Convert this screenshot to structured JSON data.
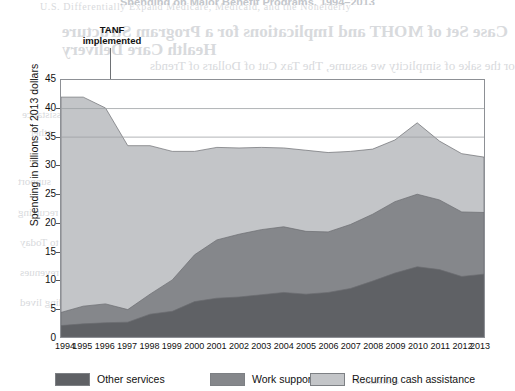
{
  "page": {
    "clipped_header": "Spending on Major Benefit Programs, 1994–2013"
  },
  "bleed_through": {
    "l1": "U.S. Differentially Expand Medicare, Medicaid, and the Nonelderly",
    "l2": "Case Set of MOHT and Implications for a Program Structure",
    "l3": "Health Care Delivery",
    "l4": "or the sake of simplicity we assume, The Tax Cut of Dollars of Trends",
    "l5": "assistance",
    "l6": "other",
    "l7": "support",
    "l8": "recurring",
    "l9": "How did data expenditures come to Today",
    "l10": "shape of revenues",
    "l11": "spending lived",
    "l12": "assistance"
  },
  "annotation": {
    "line1": "TANF",
    "line2": "implemented"
  },
  "axis": {
    "y_title": "Spending in billions of 2013 dollars",
    "y_ticks": [
      "0",
      "5",
      "10",
      "15",
      "20",
      "25",
      "30",
      "35",
      "40",
      "45"
    ],
    "x_ticks": [
      "1994",
      "1995",
      "1996",
      "1997",
      "1998",
      "1999",
      "2000",
      "2001",
      "2002",
      "2003",
      "2004",
      "2005",
      "2006",
      "2007",
      "2008",
      "2009",
      "2010",
      "2011",
      "2012",
      "2013"
    ]
  },
  "legend": {
    "items": [
      {
        "label": "Other services",
        "color": "#5f6165"
      },
      {
        "label": "Work support",
        "color": "#85878b"
      },
      {
        "label": "Recurring cash assistance",
        "color": "#c3c5c8"
      }
    ]
  },
  "chart_data": {
    "type": "area",
    "stacked": true,
    "title": "Spending on Major Benefit Programs, 1994–2013",
    "xlabel": "",
    "ylabel": "Spending in billions of 2013 dollars",
    "ylim": [
      0,
      45
    ],
    "grid": true,
    "gridlines": [
      35,
      40,
      45
    ],
    "annotations": [
      {
        "text": "TANF implemented",
        "x": "1996.5",
        "type": "vertical-line"
      }
    ],
    "legend_position": "bottom",
    "x": [
      1994,
      1995,
      1996,
      1997,
      1998,
      1999,
      2000,
      2001,
      2002,
      2003,
      2004,
      2005,
      2006,
      2007,
      2008,
      2009,
      2010,
      2011,
      2012,
      2013
    ],
    "series": [
      {
        "name": "Other services",
        "color": "#5f6165",
        "values": [
          2.0,
          2.3,
          2.5,
          2.6,
          4.0,
          4.5,
          6.2,
          6.8,
          7.0,
          7.4,
          7.8,
          7.5,
          7.8,
          8.5,
          9.8,
          11.2,
          12.3,
          11.8,
          10.6,
          11.0
        ]
      },
      {
        "name": "Work support",
        "color": "#85878b",
        "values": [
          2.3,
          3.1,
          3.3,
          2.2,
          3.5,
          5.5,
          8.2,
          10.2,
          11.0,
          11.4,
          11.5,
          11.0,
          10.6,
          11.2,
          11.7,
          12.5,
          12.7,
          12.2,
          11.3,
          10.8
        ]
      },
      {
        "name": "Recurring cash assistance",
        "color": "#c3c5c8",
        "values": [
          37.7,
          36.6,
          34.3,
          28.7,
          26.0,
          22.5,
          18.1,
          16.2,
          15.1,
          14.4,
          13.8,
          14.2,
          13.9,
          12.8,
          11.4,
          10.8,
          12.5,
          10.3,
          10.2,
          9.7
        ]
      }
    ],
    "totals": [
      42.0,
      42.0,
      40.1,
      33.5,
      33.5,
      32.5,
      32.5,
      33.2,
      33.1,
      33.2,
      33.1,
      32.7,
      32.3,
      32.5,
      32.9,
      34.5,
      37.5,
      34.3,
      32.1,
      31.5
    ]
  }
}
